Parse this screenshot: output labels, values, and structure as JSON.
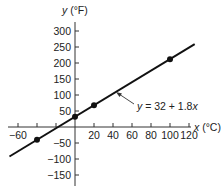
{
  "chart_data": {
    "type": "line",
    "title": "",
    "xlabel": "x (°C)",
    "ylabel": "y (°F)",
    "xlabel_var": "x",
    "xlabel_unit": " (°C)",
    "ylabel_var": "y",
    "ylabel_unit": " (°F)",
    "xlim": [
      -69,
      126
    ],
    "ylim": [
      -185,
      325
    ],
    "grid": false,
    "x_ticks": [
      -60,
      -40,
      -20,
      20,
      40,
      60,
      80,
      100,
      120
    ],
    "x_tick_labels": [
      "−60",
      "",
      "",
      "20",
      "40",
      "60",
      "80",
      "100",
      "120"
    ],
    "y_ticks": [
      300,
      250,
      200,
      150,
      100,
      50,
      -50,
      -100,
      -150
    ],
    "y_tick_labels": [
      "300",
      "250",
      "200",
      "150",
      "100",
      "50",
      "−50",
      "−100",
      "−150"
    ],
    "series": [
      {
        "name": "y = 32 + 1.8x",
        "equation": "y = 32 + 1.8x",
        "slope": 1.8,
        "intercept": 32,
        "x_range": [
          -69,
          126
        ],
        "color": "#111111"
      }
    ],
    "points": [
      {
        "x": -40,
        "y": -40
      },
      {
        "x": 0,
        "y": 32
      },
      {
        "x": 20,
        "y": 68
      },
      {
        "x": 100,
        "y": 212
      }
    ],
    "annotations": [
      {
        "text": "y = 32 + 1.8x",
        "arrow_to_line": true
      }
    ]
  },
  "labels": {
    "equation_y": "y",
    "equation_mid": " = 32 + 1.8",
    "equation_x": "x"
  }
}
